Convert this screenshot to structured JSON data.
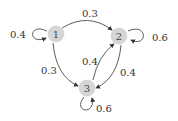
{
  "diagram": {
    "type": "markov-chain",
    "node_fill": "#d6d6d6",
    "edge_color": "#333333",
    "nodes": [
      {
        "id": "1",
        "label": "1"
      },
      {
        "id": "2",
        "label": "2"
      },
      {
        "id": "3",
        "label": "3"
      }
    ],
    "edges": [
      {
        "from": "1",
        "to": "1",
        "label": "0.4"
      },
      {
        "from": "1",
        "to": "2",
        "label": "0.3"
      },
      {
        "from": "1",
        "to": "3",
        "label": "0.3"
      },
      {
        "from": "2",
        "to": "2",
        "label": "0.6"
      },
      {
        "from": "2",
        "to": "3",
        "label": "0.4"
      },
      {
        "from": "3",
        "to": "2",
        "label": "0.4"
      },
      {
        "from": "3",
        "to": "3",
        "label": "0.6"
      }
    ]
  }
}
